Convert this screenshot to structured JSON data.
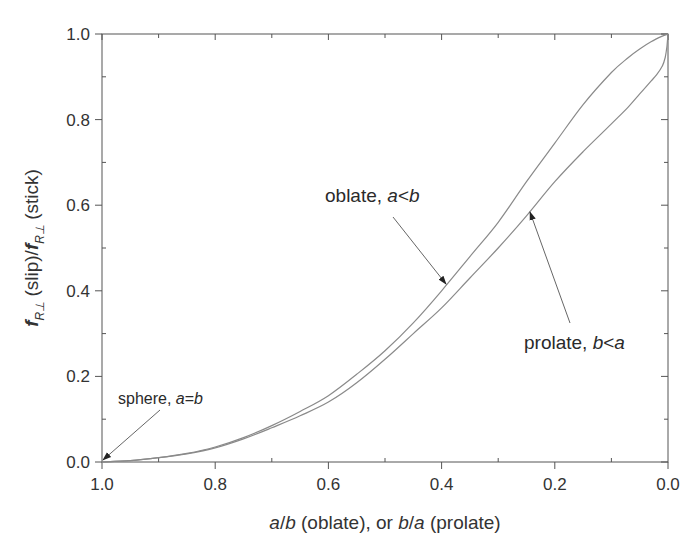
{
  "chart_data": {
    "type": "line",
    "title": "",
    "xlabel": "a/b (oblate), or b/a (prolate)",
    "xlabel_parts": [
      {
        "text": "a",
        "italic": true
      },
      {
        "text": "/",
        "italic": false
      },
      {
        "text": "b",
        "italic": true
      },
      {
        "text": " (oblate), or ",
        "italic": false
      },
      {
        "text": "b",
        "italic": true
      },
      {
        "text": "/",
        "italic": false
      },
      {
        "text": "a",
        "italic": true
      },
      {
        "text": " (prolate)",
        "italic": false
      }
    ],
    "ylabel": "f_R⊥(slip)/f_R⊥(stick)",
    "ylabel_parts": {
      "f1": "f",
      "sub1": "R⊥",
      "mid": " (slip)/",
      "f2": "f",
      "sub2": "R⊥",
      "end": " (stick)"
    },
    "xlim": [
      1.0,
      0.0
    ],
    "ylim": [
      0.0,
      1.0
    ],
    "x_reversed": true,
    "grid": false,
    "legend": null,
    "xticks": [
      "1.0",
      "0.8",
      "0.6",
      "0.4",
      "0.2",
      "0.0"
    ],
    "xtick_values": [
      1.0,
      0.8,
      0.6,
      0.4,
      0.2,
      0.0
    ],
    "xminor_ticks": [
      0.9,
      0.7,
      0.5,
      0.3,
      0.1
    ],
    "yticks": [
      "0.0",
      "0.2",
      "0.4",
      "0.6",
      "0.8",
      "1.0"
    ],
    "ytick_values": [
      0.0,
      0.2,
      0.4,
      0.6,
      0.8,
      1.0
    ],
    "yminor_ticks": [
      0.1,
      0.3,
      0.5,
      0.7,
      0.9
    ],
    "series": [
      {
        "name": "oblate, a<b",
        "x": [
          1.0,
          0.95,
          0.9,
          0.85,
          0.8,
          0.75,
          0.7,
          0.65,
          0.6,
          0.55,
          0.5,
          0.45,
          0.4,
          0.35,
          0.3,
          0.25,
          0.2,
          0.15,
          0.1,
          0.07,
          0.05,
          0.03,
          0.01,
          0.0
        ],
        "values": [
          0.0,
          0.003,
          0.01,
          0.02,
          0.035,
          0.057,
          0.085,
          0.118,
          0.155,
          0.205,
          0.26,
          0.325,
          0.4,
          0.48,
          0.56,
          0.655,
          0.745,
          0.835,
          0.91,
          0.945,
          0.965,
          0.982,
          0.995,
          1.0
        ]
      },
      {
        "name": "prolate, b<a",
        "x": [
          1.0,
          0.95,
          0.9,
          0.85,
          0.8,
          0.75,
          0.7,
          0.65,
          0.6,
          0.55,
          0.5,
          0.45,
          0.4,
          0.35,
          0.3,
          0.25,
          0.2,
          0.15,
          0.1,
          0.07,
          0.05,
          0.03,
          0.02,
          0.01,
          0.005,
          0.002,
          0.0
        ],
        "values": [
          0.0,
          0.003,
          0.01,
          0.019,
          0.033,
          0.054,
          0.08,
          0.108,
          0.14,
          0.185,
          0.24,
          0.3,
          0.36,
          0.43,
          0.5,
          0.575,
          0.655,
          0.725,
          0.79,
          0.83,
          0.86,
          0.89,
          0.905,
          0.925,
          0.945,
          0.97,
          1.0
        ]
      }
    ],
    "annotations": [
      {
        "id": "oblate",
        "parts": [
          {
            "text": "oblate, ",
            "italic": false
          },
          {
            "text": "a",
            "italic": true
          },
          {
            "text": "<",
            "italic": false
          },
          {
            "text": "b",
            "italic": true
          }
        ],
        "text_pos": [
          325,
          202
        ],
        "arrow_from": [
          393,
          217
        ],
        "arrow_to": [
          446,
          284
        ]
      },
      {
        "id": "prolate",
        "parts": [
          {
            "text": "prolate, ",
            "italic": false
          },
          {
            "text": "b",
            "italic": true
          },
          {
            "text": "<",
            "italic": false
          },
          {
            "text": "a",
            "italic": true
          }
        ],
        "text_pos": [
          524,
          349
        ],
        "arrow_from": [
          570,
          323
        ],
        "arrow_to": [
          530,
          212
        ]
      },
      {
        "id": "sphere",
        "parts": [
          {
            "text": "sphere, ",
            "italic": false
          },
          {
            "text": "a",
            "italic": true
          },
          {
            "text": "=",
            "italic": false
          },
          {
            "text": "b",
            "italic": true
          }
        ],
        "text_pos": [
          118,
          404
        ],
        "arrow_from": [
          160,
          410
        ],
        "arrow_to": [
          103,
          460
        ]
      }
    ],
    "colors": {
      "curve": "#8a8a8a",
      "axis": "#555555",
      "arrow": "#666666",
      "text": "#2a2a2a"
    }
  }
}
